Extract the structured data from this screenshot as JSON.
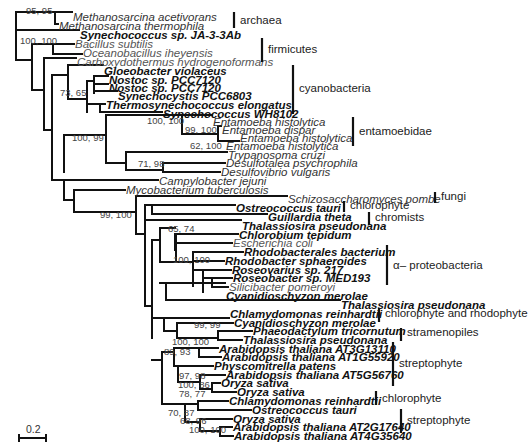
{
  "figure": {
    "type": "phylogenetic_tree",
    "scale_bar_label": "0.2",
    "leaves": [
      {
        "id": "l0",
        "text": "Methanosarcina acetivorans",
        "style": "plain",
        "x": 72,
        "y": 17
      },
      {
        "id": "l1",
        "text": "Methanosarcina thermophila",
        "style": "plain",
        "x": 58,
        "y": 26
      },
      {
        "id": "l2",
        "text": "Synechococcus sp. JA-3-3Ab",
        "style": "bold",
        "x": 79,
        "y": 35
      },
      {
        "id": "l3",
        "text": "Bacillus subtilis",
        "style": "grey",
        "x": 74,
        "y": 44
      },
      {
        "id": "l4",
        "text": "Oceanobacillus iheyensis",
        "style": "grey",
        "x": 82,
        "y": 53
      },
      {
        "id": "l5",
        "text": "Carboxydothermus hydrogenoformans",
        "style": "grey",
        "x": 76,
        "y": 62
      },
      {
        "id": "l6",
        "text": "Gloeobacter violaceus",
        "style": "bold",
        "x": 103,
        "y": 71
      },
      {
        "id": "l7",
        "text": "Nostoc sp. PCC7120",
        "style": "bold",
        "x": 108,
        "y": 80
      },
      {
        "id": "l8",
        "text": "Nostoc sp. PCC7120",
        "style": "bold",
        "x": 108,
        "y": 88
      },
      {
        "id": "l9",
        "text": "Synechocystis PCC6803",
        "style": "bold",
        "x": 117,
        "y": 96
      },
      {
        "id": "l10",
        "text": "Thermosynechococcus elongatus",
        "style": "bold",
        "x": 105,
        "y": 105
      },
      {
        "id": "l11",
        "text": "Synechococcus WH8102",
        "style": "bold",
        "x": 162,
        "y": 114
      },
      {
        "id": "l12",
        "text": "Entamoeba histolytica",
        "style": "plain",
        "x": 212,
        "y": 122
      },
      {
        "id": "l13",
        "text": "Entamoeba dispar",
        "style": "plain",
        "x": 221,
        "y": 130
      },
      {
        "id": "l14",
        "text": "Entamoeba histolytica",
        "style": "plain",
        "x": 239,
        "y": 138
      },
      {
        "id": "l15",
        "text": "Entamoeba histolytica",
        "style": "plain",
        "x": 225,
        "y": 146
      },
      {
        "id": "l16",
        "text": "Trypanosoma cruzi",
        "style": "plain",
        "x": 227,
        "y": 155
      },
      {
        "id": "l17",
        "text": "Desulfotalea psychrophila",
        "style": "plain",
        "x": 225,
        "y": 163
      },
      {
        "id": "l18",
        "text": "Desulfovibrio vulgaris",
        "style": "plain",
        "x": 220,
        "y": 172
      },
      {
        "id": "l19",
        "text": "Campylobacter jejuni",
        "style": "plain",
        "x": 158,
        "y": 181
      },
      {
        "id": "l20",
        "text": "Mycobacterium tuberculosis",
        "style": "plain",
        "x": 125,
        "y": 190
      },
      {
        "id": "l21",
        "text": "Schizosaccharomyces pombe",
        "style": "plain",
        "x": 287,
        "y": 199
      },
      {
        "id": "l22",
        "text": "Ostreococcus tauri",
        "style": "bold",
        "x": 235,
        "y": 208
      },
      {
        "id": "l23",
        "text": "Guillardia theta",
        "style": "bold",
        "x": 267,
        "y": 217
      },
      {
        "id": "l24",
        "text": "Thalassiosira pseudonana",
        "style": "bold",
        "x": 241,
        "y": 226
      },
      {
        "id": "l25",
        "text": "Chlorobium tepidum",
        "style": "bold",
        "x": 238,
        "y": 235
      },
      {
        "id": "l26",
        "text": "Escherichia coli",
        "style": "grey",
        "x": 232,
        "y": 243
      },
      {
        "id": "l27",
        "text": "Rhodobacterales bacterium",
        "style": "bold",
        "x": 243,
        "y": 252
      },
      {
        "id": "l28",
        "text": "Rhodobacter sphaeroides",
        "style": "bold",
        "x": 224,
        "y": 261
      },
      {
        "id": "l29",
        "text": "Roseovarius sp. 217",
        "style": "bold",
        "x": 231,
        "y": 270
      },
      {
        "id": "l30",
        "text": "Roseobacter sp. MED193",
        "style": "bold",
        "x": 232,
        "y": 278
      },
      {
        "id": "l31",
        "text": "Silicibacter pomeroyi",
        "style": "grey",
        "x": 228,
        "y": 287
      },
      {
        "id": "l32",
        "text": "Cyanidioschyzon merolae",
        "style": "bold",
        "x": 225,
        "y": 296
      },
      {
        "id": "l33",
        "text": "Thalassiosira pseudonana",
        "style": "bold",
        "x": 340,
        "y": 305
      },
      {
        "id": "l34",
        "text": "Chlamydomonas reinhardtii",
        "style": "bold",
        "x": 229,
        "y": 314
      },
      {
        "id": "l35",
        "text": "Cyanidioschyzon merolae",
        "style": "bold",
        "x": 233,
        "y": 323
      },
      {
        "id": "l36",
        "text": "Phaeodactylum tricornutum",
        "style": "bold",
        "x": 252,
        "y": 331
      },
      {
        "id": "l37",
        "text": "Thalassiosira pseudonana",
        "style": "bold",
        "x": 242,
        "y": 340
      },
      {
        "id": "l38",
        "text": "Arabidopsis thaliana AT3G13110",
        "style": "bold",
        "x": 218,
        "y": 349
      },
      {
        "id": "l39",
        "text": "Arabidopsis thaliana AT1G55920",
        "style": "bold",
        "x": 221,
        "y": 357
      },
      {
        "id": "l40",
        "text": "Physcomitrella patens",
        "style": "bold",
        "x": 213,
        "y": 366
      },
      {
        "id": "l41",
        "text": "Arabidopsis thaliana AT5G56760",
        "style": "bold",
        "x": 225,
        "y": 375
      },
      {
        "id": "l42",
        "text": "Oryza sativa",
        "style": "bold",
        "x": 220,
        "y": 383
      },
      {
        "id": "l43",
        "text": "Oryza sativa",
        "style": "bold",
        "x": 236,
        "y": 392
      },
      {
        "id": "l44",
        "text": "Chlamydomonas reinhardtii",
        "style": "bold",
        "x": 228,
        "y": 401
      },
      {
        "id": "l45",
        "text": "Ostreococcus tauri",
        "style": "bold",
        "x": 251,
        "y": 410
      },
      {
        "id": "l46",
        "text": "Oryza sativa",
        "style": "bold",
        "x": 232,
        "y": 419
      },
      {
        "id": "l47",
        "text": "Arabidopsis thaliana AT2G17640",
        "style": "bold",
        "x": 232,
        "y": 427
      },
      {
        "id": "l48",
        "text": "Arabidopsis thaliana AT4G35640",
        "style": "bold",
        "x": 233,
        "y": 436
      }
    ],
    "support_values": [
      {
        "text": "95, 95",
        "x": 26,
        "y": 14
      },
      {
        "text": "100, 100",
        "x": 20,
        "y": 44
      },
      {
        "text": "73, 65",
        "x": 60,
        "y": 96
      },
      {
        "text": "100, 100",
        "x": 147,
        "y": 124
      },
      {
        "text": "100, 99",
        "x": 72,
        "y": 141
      },
      {
        "text": "99, 100",
        "x": 185,
        "y": 133
      },
      {
        "text": "62, 100",
        "x": 190,
        "y": 149
      },
      {
        "text": "71, 98",
        "x": 138,
        "y": 167
      },
      {
        "text": "99, 100",
        "x": 100,
        "y": 218
      },
      {
        "text": "65, 74",
        "x": 168,
        "y": 232
      },
      {
        "text": "100, 100",
        "x": 173,
        "y": 263
      },
      {
        "text": "99, 99",
        "x": 194,
        "y": 328
      },
      {
        "text": "100, 100",
        "x": 172,
        "y": 345
      },
      {
        "text": "89, 93",
        "x": 164,
        "y": 355
      },
      {
        "text": "97, 98",
        "x": 179,
        "y": 379
      },
      {
        "text": "100, 86",
        "x": 178,
        "y": 388
      },
      {
        "text": "78, 77",
        "x": 179,
        "y": 397
      },
      {
        "text": "70, 87",
        "x": 168,
        "y": 416
      },
      {
        "text": "68, 96",
        "x": 180,
        "y": 424
      },
      {
        "text": "100, 100",
        "x": 189,
        "y": 433
      }
    ],
    "groups": [
      {
        "label": "archaea",
        "bar_x": 234,
        "y1": 12,
        "y2": 28,
        "label_x": 240,
        "label_y": 24
      },
      {
        "label": "firmicutes",
        "bar_x": 262,
        "y1": 38,
        "y2": 62,
        "label_x": 268,
        "label_y": 53
      },
      {
        "label": "cyanobacteria",
        "bar_x": 293,
        "y1": 65,
        "y2": 114,
        "label_x": 299,
        "label_y": 92
      },
      {
        "label": "entamoebidae",
        "bar_x": 353,
        "y1": 117,
        "y2": 146,
        "label_x": 359,
        "label_y": 135
      },
      {
        "label": "fungi",
        "bar_x": 435,
        "y1": 192,
        "y2": 203,
        "label_x": 441,
        "label_y": 200
      },
      {
        "label": "chlorophyte",
        "bar_x": 344,
        "y1": 201,
        "y2": 212,
        "label_x": 350,
        "label_y": 209
      },
      {
        "label": "chromists",
        "bar_x": 369,
        "y1": 212,
        "y2": 225,
        "label_x": 375,
        "label_y": 221
      },
      {
        "label": "α– proteobacteria",
        "bar_x": 387,
        "y1": 245,
        "y2": 285,
        "label_x": 393,
        "label_y": 269
      },
      {
        "label": "chlorophyte and rhodophyte",
        "bar_x": 379,
        "y1": 308,
        "y2": 322,
        "label_x": 385,
        "label_y": 317
      },
      {
        "label": "stramenopiles",
        "bar_x": 401,
        "y1": 328,
        "y2": 341,
        "label_x": 407,
        "label_y": 336
      },
      {
        "label": "streptophyte",
        "bar_x": 393,
        "y1": 342,
        "y2": 386,
        "label_x": 399,
        "label_y": 367
      },
      {
        "label": "chlorophyte",
        "bar_x": 376,
        "y1": 391,
        "y2": 405,
        "label_x": 382,
        "label_y": 402
      },
      {
        "label": "streptophyte",
        "bar_x": 401,
        "y1": 409,
        "y2": 433,
        "label_x": 407,
        "label_y": 424
      }
    ],
    "branches": [
      "M16,12 V60",
      "M16,12 H55",
      "M55,12 V24 H58",
      "M55,12 H72",
      "M16,30 H79",
      "M16,60 H32",
      "M32,44 V90 H44",
      "M32,44 H53",
      "M53,44 V54 H82",
      "M53,44 H74",
      "M44,58 V130 H52",
      "M44,58 H76",
      "M52,75 V180 H64",
      "M52,75 H68",
      "M68,65 V99",
      "M68,65 H103",
      "M68,99 H87",
      "M87,81 V112",
      "M87,81 H94",
      "M94,76 V93",
      "M94,76 H108",
      "M94,84 H108",
      "M94,91 H117",
      "M87,104 H100",
      "M100,104 V112 H162",
      "M100,104 H105",
      "M64,135 V172",
      "M64,135 H106",
      "M106,115 V163",
      "M106,115 H182",
      "M182,115 V134 H218",
      "M182,115 H212",
      "M218,126 V141 H239",
      "M218,126 H221",
      "M218,141 H225",
      "M106,163 H126",
      "M126,152 V170",
      "M126,152 H227",
      "M126,170 H163",
      "M163,163 V172",
      "M163,163 H225",
      "M163,172 H220",
      "M64,180 V200",
      "M64,180 H158",
      "M64,200 H74",
      "M74,190 V212",
      "M74,190 H125",
      "M74,212 H136",
      "M136,196 V234",
      "M136,196 H287",
      "M136,234 H145",
      "M145,205 V306",
      "M145,205 H152",
      "M152,205 V214 H267",
      "M152,205 H235",
      "M145,220 H241",
      "M145,306 H152",
      "M152,240 V338",
      "M152,240 H160",
      "M160,228 V262",
      "M160,228 H175",
      "M175,234 V250",
      "M175,234 H238",
      "M175,243 H232",
      "M160,262 H176",
      "M176,234 V262",
      "M176,262 H193",
      "M193,252 V286",
      "M193,252 H243",
      "M193,261 H224",
      "M193,270 H203",
      "M203,270 V292",
      "M203,270 H231",
      "M203,278 H212",
      "M212,278 V287 H228",
      "M212,278 H232",
      "M160,283 H166",
      "M166,283 V300",
      "M166,283 H225",
      "M166,300 H340",
      "M152,318 H164",
      "M164,318 V331",
      "M164,318 H229",
      "M164,331 H177",
      "M177,323 V338",
      "M177,323 H233",
      "M177,338 H218",
      "M218,331 V340",
      "M218,331 H252",
      "M218,340 H242",
      "M152,360 H162",
      "M162,352 V404",
      "M162,352 H174",
      "M174,348 V366",
      "M174,348 H199",
      "M199,348 V357 H221",
      "M199,348 H218",
      "M174,366 H178",
      "M178,366 V382",
      "M178,366 H213",
      "M178,382 H200",
      "M200,375 V389",
      "M200,375 H225",
      "M200,389 H212",
      "M212,383 V392",
      "M212,383 H220",
      "M212,392 H236",
      "M162,404 H185",
      "M185,404 V422",
      "M185,404 H198",
      "M198,401 V410",
      "M198,401 H228",
      "M198,410 H251",
      "M185,422 H200",
      "M200,419 V431",
      "M200,419 H232",
      "M200,431 H220",
      "M220,427 V436",
      "M220,427 H232",
      "M220,436 H233"
    ]
  }
}
